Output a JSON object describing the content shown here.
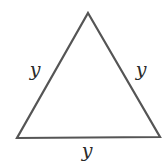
{
  "diagram": {
    "type": "equilateral-triangle",
    "stroke_color": "#555555",
    "label_color": "#2a2a2a",
    "vertices": {
      "apex": [
        88,
        13
      ],
      "bottom_left": [
        17,
        138
      ],
      "bottom_right": [
        160,
        137
      ]
    },
    "sides": [
      {
        "name": "left",
        "label": "y",
        "label_pos": [
          35,
          76
        ]
      },
      {
        "name": "right",
        "label": "y",
        "label_pos": [
          141,
          76
        ]
      },
      {
        "name": "bottom",
        "label": "y",
        "label_pos": [
          87,
          155
        ]
      }
    ]
  }
}
